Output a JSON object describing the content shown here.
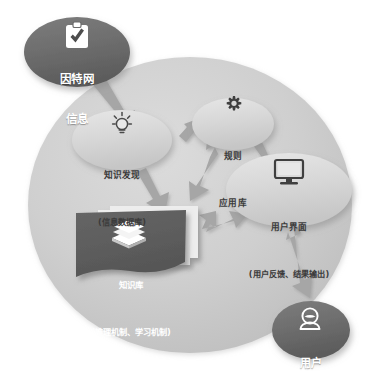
{
  "diagram": {
    "background_ellipse_color": "#c9c9c9",
    "dark_node_color": "#6b6b6b",
    "light_node_color": "#d5d5d5",
    "knowledge_card_color": "#5e5e5e",
    "arrow_color": "#a0a0a0",
    "canvas": {
      "width": 368,
      "height": 377
    }
  },
  "nodes": {
    "internet": {
      "id": "internet-info",
      "title": "因特网",
      "subtitle": "信息",
      "icon": "clipboard-check-icon",
      "style": "dark-ellipse",
      "color": "#6b6b6b",
      "text_color": "#ffffff",
      "cx": 77,
      "cy": 52,
      "rx": 53,
      "ry": 35
    },
    "knowledge_discovery": {
      "id": "knowledge-discovery",
      "title": "知识发现",
      "subtitle": "(信息数据库)",
      "icon": "lightbulb-icon",
      "style": "light-ellipse",
      "color": "#d8d8d8",
      "text_color": "#3b3b3b",
      "cx": 122,
      "cy": 140,
      "rx": 50,
      "ry": 30
    },
    "rules": {
      "id": "rule-application-library",
      "title": "规则",
      "subtitle": "应用库",
      "icon": "gear-icon",
      "style": "light-ellipse",
      "color": "#d8d8d8",
      "text_color": "#3b3b3b",
      "cx": 233,
      "cy": 124,
      "rx": 41,
      "ry": 26
    },
    "user_interface": {
      "id": "user-interface",
      "title": "用户界面",
      "subtitle": "(用户反馈、结果输出)",
      "icon": "monitor-icon",
      "style": "light-ellipse",
      "color": "#d8d8d8",
      "text_color": "#3b3b3b",
      "cx": 289,
      "cy": 190,
      "rx": 63,
      "ry": 37
    },
    "knowledge_base": {
      "id": "knowledge-base",
      "title": "知识库",
      "subtitle": "(推理机制、学习机制)",
      "icon": "books-stack-icon",
      "style": "dark-card",
      "color": "#5e5e5e",
      "text_color": "#ffffff",
      "x": 78,
      "y": 213,
      "width": 110,
      "height": 63
    },
    "user": {
      "id": "end-user",
      "title": "用户",
      "subtitle": "",
      "icon": "person-icon",
      "style": "dark-ellipse",
      "color": "#6b6b6b",
      "text_color": "#ffffff",
      "cx": 311,
      "cy": 330,
      "rx": 39,
      "ry": 29
    }
  },
  "edges": [
    {
      "id": "edge-internet-to-discovery",
      "from": "因特网信息",
      "to": "知识发现",
      "direction": "one-way"
    },
    {
      "id": "edge-discovery-to-rules",
      "from": "知识发现",
      "to": "规则应用库",
      "direction": "two-way"
    },
    {
      "id": "edge-discovery-to-knowledgebase",
      "from": "知识发现",
      "to": "知识库",
      "direction": "one-way"
    },
    {
      "id": "edge-rules-to-knowledgebase",
      "from": "规则应用库",
      "to": "知识库",
      "direction": "two-way"
    },
    {
      "id": "edge-rules-to-ui",
      "from": "规则应用库",
      "to": "用户界面",
      "direction": "one-way"
    },
    {
      "id": "edge-knowledgebase-to-ui",
      "from": "知识库",
      "to": "用户界面",
      "direction": "two-way"
    },
    {
      "id": "edge-ui-to-user",
      "from": "用户界面",
      "to": "用户",
      "direction": "two-way"
    }
  ]
}
